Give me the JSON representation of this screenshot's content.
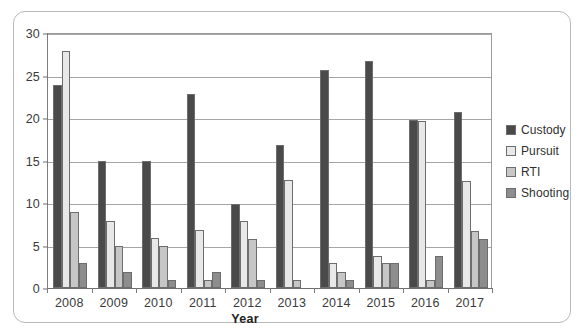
{
  "chart_data": {
    "type": "bar",
    "title": "",
    "xlabel": "Year",
    "ylabel": "",
    "categories": [
      "2008",
      "2009",
      "2010",
      "2011",
      "2012",
      "2013",
      "2014",
      "2015",
      "2016",
      "2017"
    ],
    "ylim": [
      0,
      30
    ],
    "yticks": [
      0,
      5,
      10,
      15,
      20,
      25,
      30
    ],
    "ytick_labels": [
      "0",
      "5",
      "10",
      "15",
      "20",
      "25",
      "30"
    ],
    "grid": "horizontal",
    "legend_position": "right",
    "series": [
      {
        "name": "Custody",
        "color": "#4a4a4a",
        "values": [
          23.9,
          15.0,
          15.0,
          22.8,
          9.9,
          16.8,
          25.7,
          26.7,
          19.8,
          20.7
        ]
      },
      {
        "name": "Pursuit",
        "color": "#e8e8e8",
        "values": [
          27.9,
          7.9,
          5.9,
          6.8,
          7.9,
          12.7,
          2.9,
          3.8,
          19.7,
          12.6
        ]
      },
      {
        "name": "RTI",
        "color": "#c6c6c6",
        "values": [
          8.9,
          4.9,
          4.9,
          0.9,
          5.8,
          1.0,
          1.9,
          2.9,
          0.9,
          6.7
        ]
      },
      {
        "name": "Shooting",
        "color": "#8d8d8d",
        "values": [
          2.9,
          1.9,
          0.9,
          1.9,
          0.9,
          0.0,
          0.9,
          2.9,
          3.8,
          5.8
        ]
      }
    ]
  }
}
